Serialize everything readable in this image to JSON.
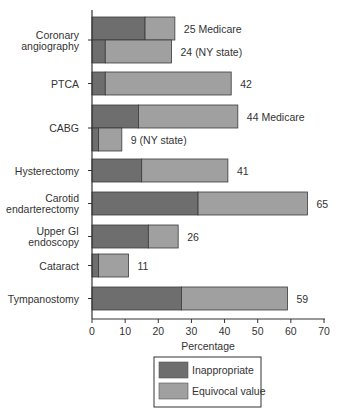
{
  "chart_data": {
    "type": "bar",
    "orientation": "horizontal",
    "stacked": true,
    "title": "",
    "xlabel": "Percentage",
    "ylabel": "",
    "xlim": [
      0,
      70
    ],
    "xticks": [
      0,
      10,
      20,
      30,
      40,
      50,
      60,
      70
    ],
    "grid": false,
    "legend_position": "bottom-center",
    "series": [
      {
        "name": "Inappropriate",
        "color": "#6e6e6e"
      },
      {
        "name": "Equivocal value",
        "color": "#a0a0a0"
      }
    ],
    "groups": [
      {
        "category": [
          "Coronary",
          "angiography"
        ],
        "bars": [
          {
            "inappropriate": 16,
            "equivocal": 9,
            "total": 25,
            "label": "25 Medicare"
          },
          {
            "inappropriate": 4,
            "equivocal": 20,
            "total": 24,
            "label": "24 (NY state)"
          }
        ]
      },
      {
        "category": [
          "PTCA"
        ],
        "bars": [
          {
            "inappropriate": 4,
            "equivocal": 38,
            "total": 42,
            "label": "42"
          }
        ]
      },
      {
        "category": [
          "CABG"
        ],
        "bars": [
          {
            "inappropriate": 14,
            "equivocal": 30,
            "total": 44,
            "label": "44 Medicare"
          },
          {
            "inappropriate": 2,
            "equivocal": 7,
            "total": 9,
            "label": "9 (NY state)"
          }
        ]
      },
      {
        "category": [
          "Hysterectomy"
        ],
        "bars": [
          {
            "inappropriate": 15,
            "equivocal": 26,
            "total": 41,
            "label": "41"
          }
        ]
      },
      {
        "category": [
          "Carotid",
          "endarterectomy"
        ],
        "bars": [
          {
            "inappropriate": 32,
            "equivocal": 33,
            "total": 65,
            "label": "65"
          }
        ]
      },
      {
        "category": [
          "Upper GI",
          "endoscopy"
        ],
        "bars": [
          {
            "inappropriate": 17,
            "equivocal": 9,
            "total": 26,
            "label": "26"
          }
        ]
      },
      {
        "category": [
          "Cataract"
        ],
        "bars": [
          {
            "inappropriate": 2,
            "equivocal": 9,
            "total": 11,
            "label": "11"
          }
        ]
      },
      {
        "category": [
          "Tympanostomy"
        ],
        "bars": [
          {
            "inappropriate": 27,
            "equivocal": 32,
            "total": 59,
            "label": "59"
          }
        ]
      }
    ]
  }
}
